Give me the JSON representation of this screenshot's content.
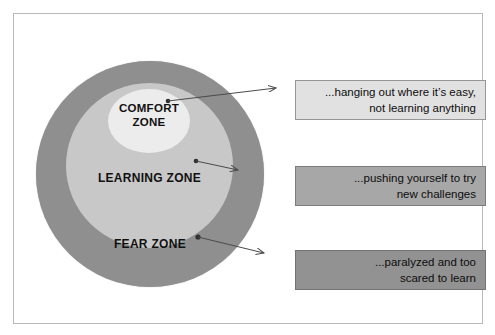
{
  "figure": {
    "background_color": "#ffffff",
    "frame_color": "#b9b9b9"
  },
  "zones": [
    {
      "id": "comfort",
      "label": "COMFORT\nZONE",
      "fill_color": "#ececec",
      "description": "...hanging out where it’s easy,\nnot learning anything",
      "callout_fill": "#e1e1e1"
    },
    {
      "id": "learning",
      "label": "LEARNING ZONE",
      "fill_color": "#c8c8c8",
      "description": "...pushing yourself to try\nnew challenges",
      "callout_fill": "#a7a7a7"
    },
    {
      "id": "fear",
      "label": "FEAR ZONE",
      "fill_color": "#8f8f8f",
      "description": "...paralyzed and too\nscared to learn",
      "callout_fill": "#929292"
    }
  ],
  "arrows": {
    "color": "#4a4a4a",
    "count": 3,
    "direction": "left-to-right"
  }
}
